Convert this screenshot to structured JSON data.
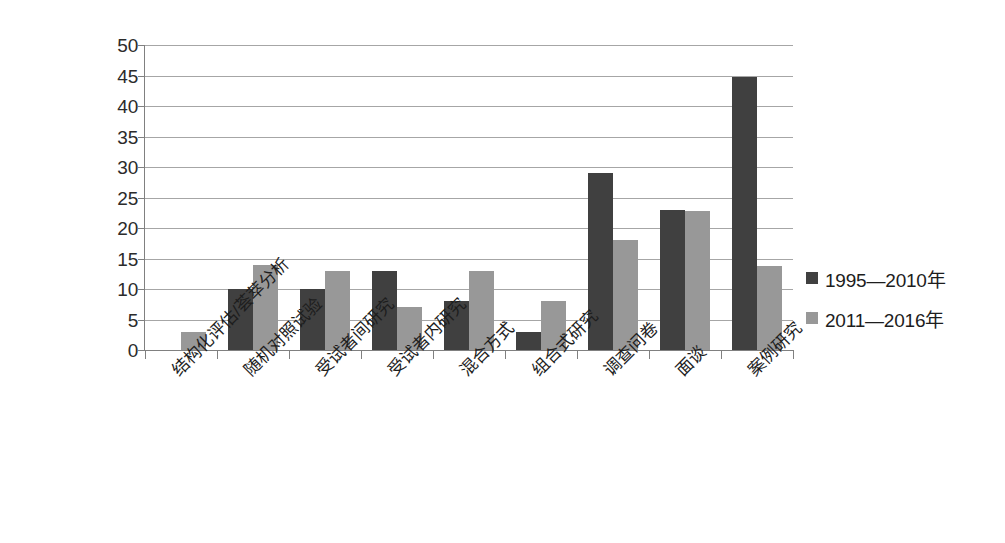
{
  "chart_data": {
    "type": "bar",
    "title": "",
    "subtitle": "",
    "xlabel": "",
    "ylabel": "",
    "ylim": [
      0,
      50
    ],
    "yticks": [
      0,
      5,
      10,
      15,
      20,
      25,
      30,
      35,
      40,
      45,
      50
    ],
    "grid": true,
    "legend_position": "right",
    "categories": [
      "结构化评估/荟萃分析",
      "随机对照试验",
      "受试者间研究",
      "受试者内研究",
      "混合方式",
      "组合式研究",
      "调查问卷",
      "面谈",
      "案例研究"
    ],
    "series": [
      {
        "name": "1995—2010年",
        "color": "#404040",
        "values": [
          0,
          10,
          10,
          13,
          8,
          3,
          29,
          23,
          44.7
        ]
      },
      {
        "name": "2011—2016年",
        "color": "#989898",
        "values": [
          3,
          14,
          13,
          7,
          13,
          8,
          18,
          22.8,
          13.7
        ]
      }
    ]
  },
  "colors": {
    "series_dark": "#404040",
    "series_light": "#989898",
    "gridline": "#a6a6a6",
    "axis": "#808080",
    "text": "#1d1d1d",
    "background": "#ffffff"
  }
}
